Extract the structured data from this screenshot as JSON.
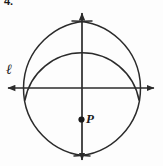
{
  "figure": {
    "problem_number": "4.",
    "width": 163,
    "height": 166,
    "background_color": "#fdfdfd",
    "stroke_color": "#2b2b2b"
  },
  "labels": {
    "line_label": "ℓ",
    "point_label": "P"
  },
  "geometry": {
    "origin": {
      "x": 82,
      "y": 88
    },
    "point_p": {
      "x": 81,
      "y": 120
    },
    "horizontal_line": {
      "name": "line-l",
      "from": {
        "x": 5,
        "y": 88
      },
      "to": {
        "x": 157,
        "y": 88
      },
      "arrows": "both"
    },
    "vertical_line": {
      "name": "perpendicular-line",
      "from": {
        "x": 82,
        "y": 10
      },
      "to": {
        "x": 82,
        "y": 163
      },
      "arrows": "both"
    },
    "arcs": [
      {
        "name": "left-compass-arc",
        "center": {
          "x": 33,
          "y": 88
        },
        "radius": 58,
        "description": "arc from left point through top and bottom intersections"
      },
      {
        "name": "right-compass-arc",
        "center": {
          "x": 131,
          "y": 88
        },
        "radius": 58,
        "description": "arc from right point through top and bottom intersections"
      },
      {
        "name": "wide-construction-arc",
        "center": {
          "x": 82,
          "y": 120
        },
        "radius": 58,
        "description": "arc centered at P crossing line l on both sides"
      }
    ],
    "intersections": [
      {
        "name": "top-arc-intersection",
        "x": 82,
        "y": 32
      },
      {
        "name": "bottom-arc-intersection",
        "x": 82,
        "y": 145
      }
    ]
  }
}
